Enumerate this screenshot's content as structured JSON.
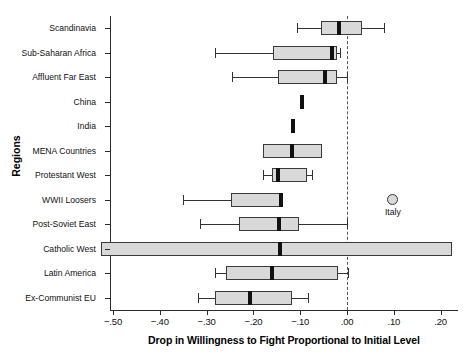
{
  "chart_data": {
    "type": "box",
    "title": "",
    "xlabel": "Drop in Willingness to Fight Proportional to Initial Level",
    "ylabel": "Regions",
    "xlim": [
      -0.525,
      0.2425
    ],
    "xticks": [
      -0.5,
      -0.4,
      -0.3,
      -0.2,
      -0.1,
      0.0,
      0.1,
      0.2
    ],
    "xticklabels": [
      "−.50",
      "−.40",
      "−.30",
      "−.20",
      "−.10",
      ".00",
      ".10",
      ".20"
    ],
    "grid": false,
    "legend": null,
    "reference_line": {
      "value": 0.0,
      "style": "dashed",
      "color": "#555555"
    },
    "categories": [
      "Scandinavia",
      "Sub-Saharan Africa",
      "Affluent Far East",
      "China",
      "India",
      "MENA Countries",
      "Protestant West",
      "WWII Loosers",
      "Post-Soviet East",
      "Catholic West",
      "Latin America",
      "Ex-Communist EU"
    ],
    "boxes": [
      {
        "category": "Scandinavia",
        "whisker_low": -0.107,
        "q1": -0.056,
        "median": -0.018,
        "q3": 0.032,
        "whisker_high": 0.079
      },
      {
        "category": "Sub-Saharan Africa",
        "whisker_low": -0.282,
        "q1": -0.158,
        "median": -0.032,
        "q3": -0.021,
        "whisker_high": -0.015
      },
      {
        "category": "Affluent Far East",
        "whisker_low": -0.246,
        "q1": -0.147,
        "median": -0.047,
        "q3": -0.021,
        "whisker_high": 0.0
      },
      {
        "category": "China",
        "whisker_low": -0.098,
        "q1": -0.098,
        "median": -0.096,
        "q3": -0.094,
        "whisker_high": -0.094
      },
      {
        "category": "India",
        "whisker_low": -0.117,
        "q1": -0.117,
        "median": -0.115,
        "q3": -0.113,
        "whisker_high": -0.113
      },
      {
        "category": "MENA Countries",
        "whisker_low": -0.179,
        "q1": -0.179,
        "median": -0.117,
        "q3": -0.053,
        "whisker_high": -0.053
      },
      {
        "category": "Protestant West",
        "whisker_low": -0.179,
        "q1": -0.16,
        "median": -0.147,
        "q3": -0.085,
        "whisker_high": -0.074
      },
      {
        "category": "WWII Loosers",
        "whisker_low": -0.35,
        "q1": -0.248,
        "median": -0.141,
        "q3": -0.141,
        "whisker_high": -0.141
      },
      {
        "category": "Post-Soviet East",
        "whisker_low": -0.314,
        "q1": -0.231,
        "median": -0.145,
        "q3": -0.103,
        "whisker_high": 0.0
      },
      {
        "category": "Catholic West",
        "whisker_low": -0.525,
        "q1": -0.525,
        "median": -0.143,
        "q3": 0.224,
        "whisker_high": 0.224
      },
      {
        "category": "Latin America",
        "whisker_low": -0.282,
        "q1": -0.258,
        "median": -0.16,
        "q3": -0.019,
        "whisker_high": 0.002
      },
      {
        "category": "Ex-Communist EU",
        "whisker_low": -0.318,
        "q1": -0.282,
        "median": -0.207,
        "q3": -0.117,
        "whisker_high": -0.083
      }
    ],
    "outliers": [
      {
        "category": "WWII Loosers",
        "value": 0.098,
        "label": "Italy"
      }
    ]
  }
}
